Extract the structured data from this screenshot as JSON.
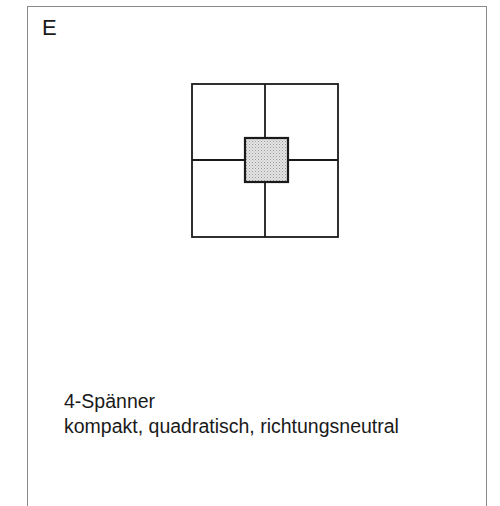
{
  "panel": {
    "label": "E"
  },
  "diagram": {
    "type": "floor-plan-schematic",
    "outer_square": {
      "x": 192,
      "y": 84,
      "width": 146,
      "height": 153
    },
    "divider_vertical_x": 265,
    "divider_horizontal_y": 160,
    "core": {
      "x": 245,
      "y": 138,
      "width": 43,
      "height": 44,
      "fill": "#d9d9d9"
    },
    "units_count": 4,
    "line_color": "#1a1a1a"
  },
  "caption": {
    "title": "4-Spänner",
    "description": "kompakt, quadratisch, richtungsneutral"
  }
}
